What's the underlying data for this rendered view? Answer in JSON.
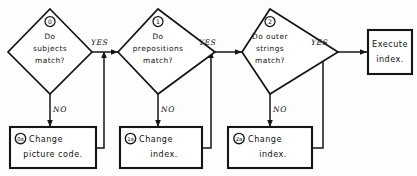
{
  "diagram": {
    "type": "flowchart",
    "title": "",
    "style": "hand-drawn black ink on white",
    "colors": {
      "stroke": "#151515",
      "fill": "#ffffff",
      "background": "#fdfdfd"
    },
    "decisions": [
      {
        "tag": "0",
        "line1": "Do",
        "line2": "subjects",
        "line3": "match?",
        "yes_label": "YES",
        "no_label": "NO"
      },
      {
        "tag": "1",
        "line1": "Do",
        "line2": "prepositions",
        "line3": "match?",
        "yes_label": "YES",
        "no_label": "NO"
      },
      {
        "tag": "2",
        "line1": "Do outer",
        "line2": "strings",
        "line3": "match?",
        "yes_label": "YES",
        "no_label": "NO"
      }
    ],
    "actions": [
      {
        "tag": "0a",
        "line1": "Change",
        "line2": "picture code."
      },
      {
        "tag": "1a",
        "line1": "Change",
        "line2": "index."
      },
      {
        "tag": "2a",
        "line1": "Change",
        "line2": "index."
      }
    ],
    "terminal": {
      "line1": "Execute",
      "line2": "index."
    }
  }
}
